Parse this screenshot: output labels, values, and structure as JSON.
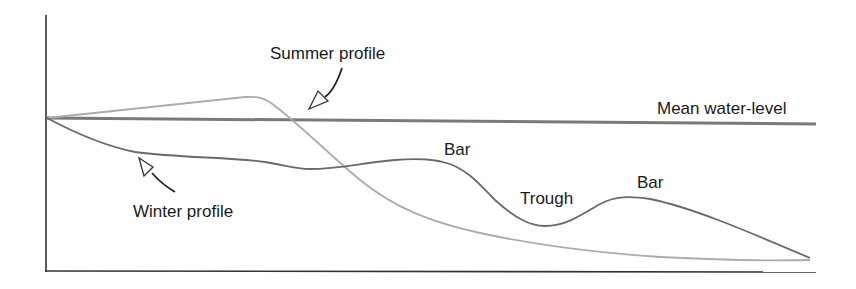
{
  "labels": {
    "summer_profile": "Summer profile",
    "winter_profile": "Winter profile",
    "mean_water_level": "Mean water-level",
    "bar_1": "Bar",
    "trough": "Trough",
    "bar_2": "Bar"
  },
  "colors": {
    "axis": "#333333",
    "mean_water_level": "#7a7a7a",
    "summer_profile": "#ababab",
    "winter_profile": "#6a6a6a",
    "arrow_outline": "#333333",
    "text": "#1a1a1a"
  },
  "elements": {
    "axes": [
      "y-axis",
      "x-axis"
    ],
    "lines": [
      "mean-water-level",
      "summer-profile",
      "winter-profile"
    ],
    "callout_arrows": [
      "summer-profile-arrow",
      "winter-profile-arrow"
    ],
    "features": [
      "bar",
      "trough",
      "bar"
    ]
  }
}
